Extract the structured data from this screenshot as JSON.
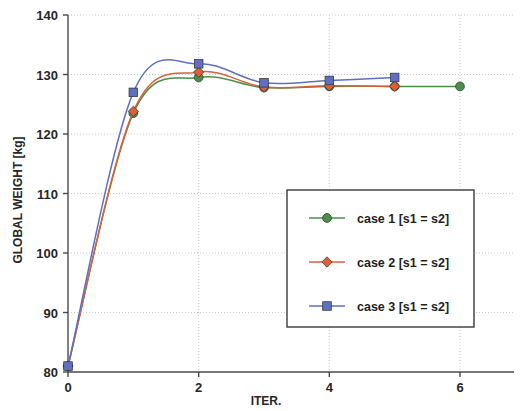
{
  "chart_data": {
    "type": "line",
    "title": "",
    "xlabel": "ITER.",
    "ylabel": "GLOBAL WEIGHT [kg]",
    "xlim": [
      0,
      7
    ],
    "ylim": [
      80,
      140
    ],
    "xticks": [
      "0",
      "2",
      "4",
      "6"
    ],
    "xtick_values": [
      0,
      2,
      4,
      6
    ],
    "yticks": [
      "80",
      "90",
      "100",
      "110",
      "120",
      "130",
      "140"
    ],
    "ytick_values": [
      80,
      90,
      100,
      110,
      120,
      130,
      140
    ],
    "grid": "dotted horizontal and vertical gridlines at major ticks",
    "legend_position": "center-right inside axes",
    "series": [
      {
        "name": "case 1 [s1 = s2]",
        "color": "#4a8f4a",
        "marker": "circle",
        "x": [
          0,
          1,
          2,
          3,
          4,
          5,
          6
        ],
        "values": [
          81.0,
          123.5,
          129.5,
          127.8,
          128.0,
          128.0,
          128.0
        ]
      },
      {
        "name": "case 2 [s1 = s2]",
        "color": "#d9613a",
        "marker": "diamond",
        "x": [
          0,
          1,
          2,
          3,
          4,
          5
        ],
        "values": [
          81.0,
          123.8,
          130.4,
          127.9,
          128.1,
          128.0
        ]
      },
      {
        "name": "case 3 [s1 = s2]",
        "color": "#5f6fc4",
        "marker": "square",
        "x": [
          0,
          1,
          2,
          3,
          4,
          5
        ],
        "values": [
          81.0,
          127.0,
          131.8,
          128.6,
          129.0,
          129.5
        ]
      }
    ]
  },
  "legend": {
    "items": [
      {
        "label": "case 1 [s1 = s2]",
        "color": "#4a8f4a",
        "marker": "circle"
      },
      {
        "label": "case 2 [s1 = s2]",
        "color": "#d9613a",
        "marker": "diamond"
      },
      {
        "label": "case 3 [s1 = s2]",
        "color": "#5f6fc4",
        "marker": "square"
      }
    ]
  },
  "colors": {
    "axis": "#4a4a4a",
    "grid": "#c9c9c9",
    "text": "#262626",
    "background": "#ffffff"
  }
}
